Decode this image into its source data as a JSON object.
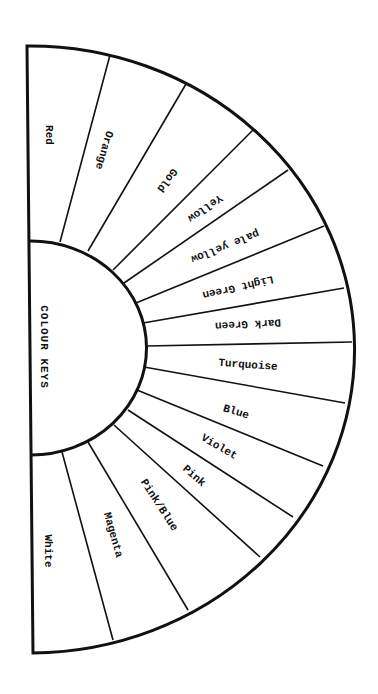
{
  "diagram": {
    "title": "COLOUR KEYS",
    "type": "semicircular colour key wheel",
    "segments": [
      {
        "label": "Red",
        "x": 49,
        "y": 135,
        "rot": 90
      },
      {
        "label": "Orange",
        "x": 104,
        "y": 150,
        "rot": 106
      },
      {
        "label": "Gold",
        "x": 167,
        "y": 180,
        "rot": 127
      },
      {
        "label": "Yellow",
        "x": 205,
        "y": 208,
        "rot": 145
      },
      {
        "label": "pale yellow",
        "x": 225,
        "y": 246,
        "rot": 158
      },
      {
        "label": "Light Green",
        "x": 238,
        "y": 287,
        "rot": 167
      },
      {
        "label": "Dark Green",
        "x": 248,
        "y": 324,
        "rot": 177
      },
      {
        "label": "Turquoise",
        "x": 248,
        "y": 365,
        "rot": 4
      },
      {
        "label": "Blue",
        "x": 236,
        "y": 412,
        "rot": 17
      },
      {
        "label": "Violet",
        "x": 219,
        "y": 447,
        "rot": 30
      },
      {
        "label": "Pink",
        "x": 194,
        "y": 476,
        "rot": 41
      },
      {
        "label": "Pink/Blue",
        "x": 159,
        "y": 505,
        "rot": 57
      },
      {
        "label": "Magenta",
        "x": 113,
        "y": 535,
        "rot": 74
      },
      {
        "label": "White",
        "x": 48,
        "y": 551,
        "rot": 90
      }
    ],
    "dividers": [
      [
        60,
        242,
        110,
        55
      ],
      [
        88,
        251,
        186,
        84
      ],
      [
        113,
        270,
        253,
        130
      ],
      [
        124,
        283,
        288,
        170
      ],
      [
        136,
        303,
        324,
        226
      ],
      [
        143,
        323,
        344,
        288
      ],
      [
        146,
        346,
        352,
        342
      ],
      [
        144,
        367,
        345,
        403
      ],
      [
        137,
        390,
        323,
        466
      ],
      [
        128,
        410,
        293,
        517
      ],
      [
        114,
        425,
        260,
        557
      ],
      [
        88,
        442,
        188,
        610
      ],
      [
        62,
        452,
        113,
        640
      ]
    ]
  },
  "colors": {
    "line": "#111111",
    "background": "#ffffff"
  }
}
